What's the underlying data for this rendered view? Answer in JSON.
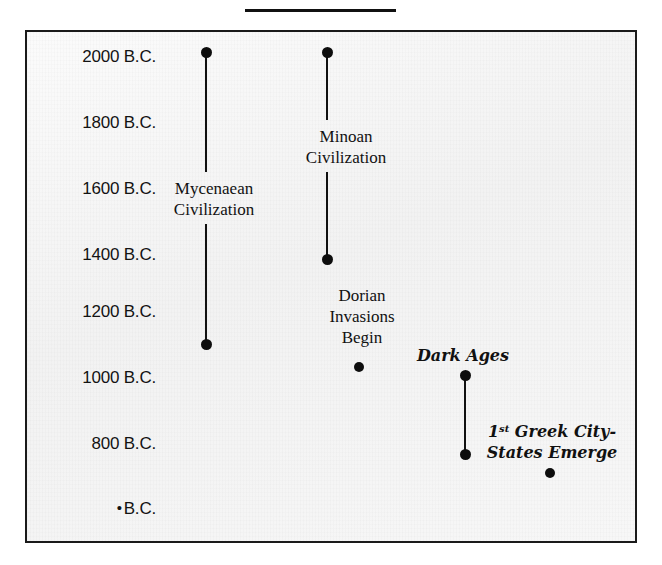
{
  "title": {
    "text": "",
    "rule_color": "#111111"
  },
  "frame": {
    "border_color": "#1a1a1a",
    "background_color": "#f6f6f6"
  },
  "marker_color": "#0d0d0d",
  "chart_data": {
    "type": "timeline",
    "title": "",
    "xlabel": "",
    "ylabel": "",
    "ylim": [
      2100,
      700
    ],
    "axis_direction": "descending B.C. downward",
    "grid": false,
    "legend": null,
    "y_ticks": [
      {
        "label": "2000 B.C.",
        "value": 2000,
        "y": 56
      },
      {
        "label": "1800 B.C.",
        "value": 1800,
        "y": 122
      },
      {
        "label": "1600 B.C.",
        "value": 1600,
        "y": 188
      },
      {
        "label": "1400 B.C.",
        "value": 1400,
        "y": 254
      },
      {
        "label": "1200 B.C.",
        "value": 1200,
        "y": 311
      },
      {
        "label": "1000 B.C.",
        "value": 1000,
        "y": 377
      },
      {
        "label": "800 B.C.",
        "value": 800,
        "y": 443
      },
      {
        "label": "B.C.",
        "value": null,
        "y": 508,
        "bullet": true
      }
    ],
    "events": [
      {
        "name": "Mycenaean Civilization",
        "lines": [
          "Mycenaean",
          "Civilization"
        ],
        "kind": "range",
        "start_value": 2000,
        "end_value": 1100,
        "x": 204,
        "y_start": 50,
        "y_end": 342,
        "label_x": 212,
        "label_y": 176,
        "label_gap_top": 170,
        "label_gap_bottom": 222
      },
      {
        "name": "Minoan Civilization",
        "lines": [
          "Minoan",
          "Civilization"
        ],
        "kind": "range",
        "start_value": 2000,
        "end_value": 1400,
        "x": 325,
        "y_start": 50,
        "y_end": 257,
        "label_x": 344,
        "label_y": 124,
        "label_gap_top": 118,
        "label_gap_bottom": 170
      },
      {
        "name": "Dorian Invasions Begin",
        "lines": [
          "Dorian",
          "Invasions",
          "Begin"
        ],
        "kind": "point",
        "start_value": 1050,
        "x": 357,
        "y_point": 365,
        "label_x": 360,
        "label_y": 283
      },
      {
        "name": "Dark Ages",
        "lines": [
          "Dark Ages"
        ],
        "kind": "range",
        "start_value": 1000,
        "end_value": 800,
        "x": 463,
        "y_start": 373,
        "y_end": 452,
        "label_x": 461,
        "label_y": 343
      },
      {
        "name": "1st Greek City-States Emerge",
        "lines": [
          "1st Greek City-",
          "States Emerge"
        ],
        "kind": "point",
        "start_value": 750,
        "x": 548,
        "y_point": 471,
        "label_x": 550,
        "label_y": 419
      }
    ]
  }
}
